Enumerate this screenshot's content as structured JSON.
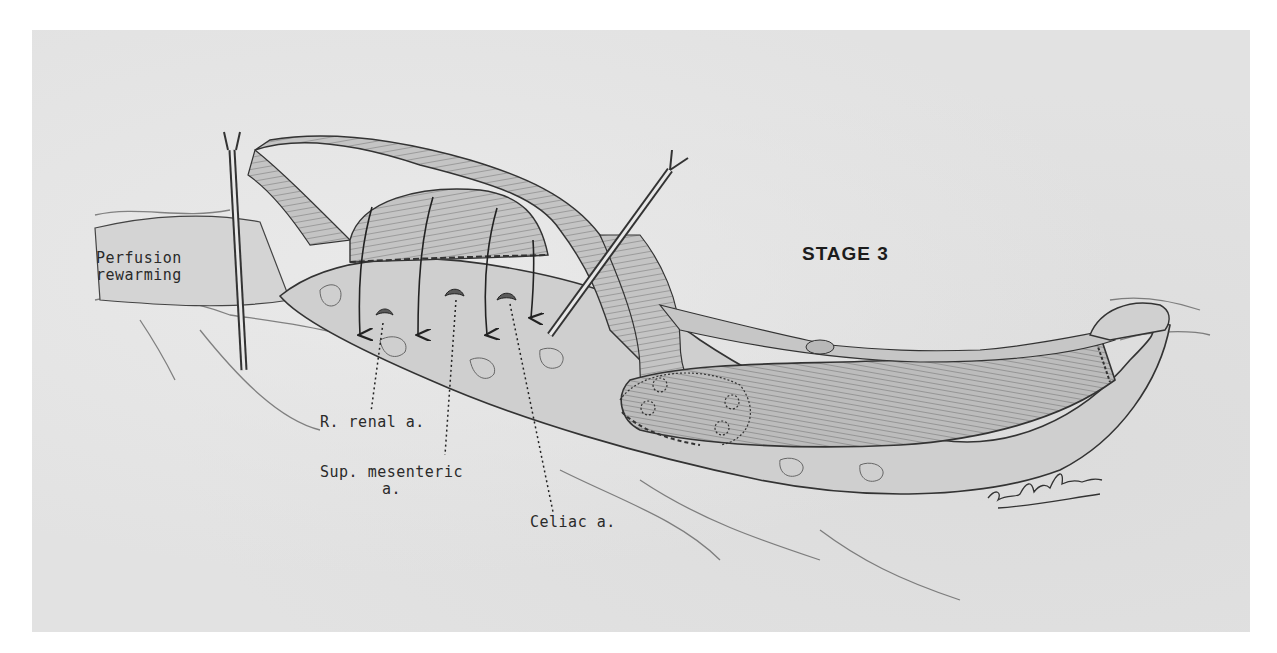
{
  "figure": {
    "title": "STAGE 3",
    "labels": {
      "perfusion": [
        "Perfusion",
        "rewarming"
      ],
      "renal": "R. renal a.",
      "mesenteric": [
        "Sup. mesenteric",
        "a."
      ],
      "celiac": "Celiac a."
    },
    "artist_signature": "signature-scribble",
    "colors": {
      "page_background": "#ffffff",
      "plate_background": "#e2e2e2",
      "ink": "#2a2a2a",
      "vessel_fill": "#c9c9c9",
      "graft_fill": "#bdbdbd"
    }
  }
}
